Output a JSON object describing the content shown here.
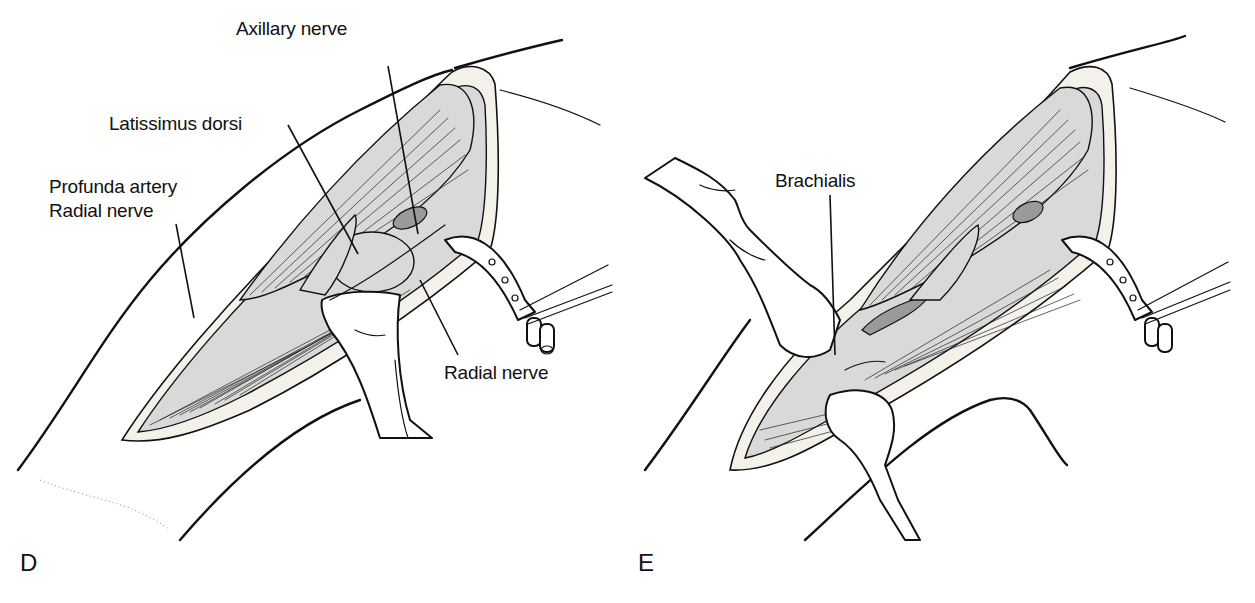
{
  "figure": {
    "panels": [
      {
        "id": "D",
        "letter": "D",
        "labels": {
          "axillary_nerve": "Axillary nerve",
          "latissimus_dorsi": "Latissimus dorsi",
          "profunda_artery": "Profunda artery",
          "radial_nerve_upper": "Radial nerve",
          "radial_nerve_lower": "Radial nerve"
        }
      },
      {
        "id": "E",
        "letter": "E",
        "labels": {
          "brachialis": "Brachialis"
        }
      }
    ],
    "colors": {
      "ink": "#111111",
      "background": "#ffffff",
      "shading": "#d9d9d9"
    }
  }
}
